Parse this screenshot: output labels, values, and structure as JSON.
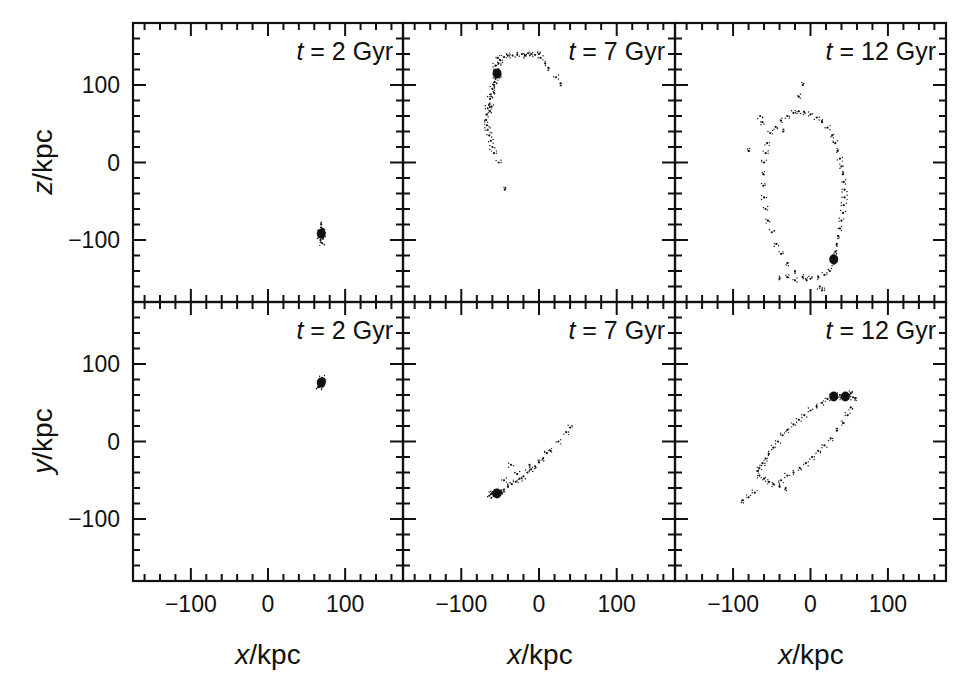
{
  "chart_data": {
    "type": "scatter",
    "title": "",
    "layout": {
      "rows": 2,
      "cols": 3,
      "shared_axes": true,
      "grid": false,
      "legend": "none"
    },
    "xlabel": "x/kpc",
    "ylabels": [
      "z/kpc",
      "y/kpc"
    ],
    "xlim": [
      -175,
      175
    ],
    "ylim": [
      -180,
      180
    ],
    "x_ticks_major": [
      -100,
      0,
      100
    ],
    "y_ticks_major": [
      -100,
      0,
      100
    ],
    "minor_tick_step": 20,
    "x_tick_labels": [
      "−100",
      "0",
      "100"
    ],
    "y_tick_labels": [
      "100",
      "0",
      "−100"
    ],
    "panels": [
      {
        "row": 0,
        "col": 0,
        "label_t": "t",
        "label_rest": " = 2 Gyr",
        "projection": "x-z",
        "core": [
          [
            69,
            -92
          ]
        ],
        "points": [
          [
            69,
            -92
          ],
          [
            70,
            -90
          ],
          [
            68,
            -94
          ],
          [
            71,
            -93
          ],
          [
            67,
            -89
          ],
          [
            70,
            -96
          ],
          [
            69,
            -84
          ],
          [
            68,
            -100
          ],
          [
            72,
            -88
          ],
          [
            66,
            -92
          ],
          [
            70,
            -104
          ],
          [
            69,
            -80
          ],
          [
            71,
            -97
          ],
          [
            67,
            -95
          ],
          [
            70,
            -87
          ]
        ]
      },
      {
        "row": 0,
        "col": 1,
        "label_t": "t",
        "label_rest": " = 7 Gyr",
        "projection": "x-z",
        "core": [
          [
            -54,
            115
          ]
        ],
        "points": [
          [
            -54,
            115
          ],
          [
            -53,
            112
          ],
          [
            -55,
            118
          ],
          [
            -52,
            110
          ],
          [
            -56,
            108
          ],
          [
            -58,
            100
          ],
          [
            -60,
            95
          ],
          [
            -62,
            88
          ],
          [
            -63,
            82
          ],
          [
            -64,
            75
          ],
          [
            -66,
            70
          ],
          [
            -67,
            62
          ],
          [
            -68,
            55
          ],
          [
            -67,
            48
          ],
          [
            -66,
            42
          ],
          [
            -64,
            35
          ],
          [
            -62,
            28
          ],
          [
            -60,
            20
          ],
          [
            -58,
            12
          ],
          [
            -52,
            0
          ],
          [
            -44,
            -35
          ],
          [
            -52,
            128
          ],
          [
            -50,
            132
          ],
          [
            -45,
            136
          ],
          [
            -40,
            138
          ],
          [
            -34,
            138
          ],
          [
            -28,
            139
          ],
          [
            -22,
            140
          ],
          [
            -18,
            138
          ],
          [
            -14,
            141
          ],
          [
            -10,
            140
          ],
          [
            -5,
            139
          ],
          [
            0,
            140
          ],
          [
            2,
            135
          ],
          [
            8,
            128
          ],
          [
            12,
            122
          ],
          [
            22,
            110
          ],
          [
            28,
            102
          ],
          [
            -56,
            125
          ],
          [
            -53,
            135
          ],
          [
            -58,
            90
          ],
          [
            -61,
            72
          ],
          [
            -63,
            66
          ],
          [
            -57,
            104
          ]
        ]
      },
      {
        "row": 0,
        "col": 2,
        "label_t": "t",
        "label_rest": " = 12 Gyr",
        "projection": "x-z",
        "core": [
          [
            30,
            -125
          ]
        ],
        "points": [
          [
            30,
            -125
          ],
          [
            31,
            -120
          ],
          [
            29,
            -130
          ],
          [
            32,
            -115
          ],
          [
            34,
            -105
          ],
          [
            36,
            -95
          ],
          [
            38,
            -85
          ],
          [
            40,
            -75
          ],
          [
            42,
            -65
          ],
          [
            43,
            -55
          ],
          [
            44,
            -45
          ],
          [
            44,
            -35
          ],
          [
            43,
            -25
          ],
          [
            42,
            -15
          ],
          [
            40,
            -5
          ],
          [
            38,
            5
          ],
          [
            35,
            15
          ],
          [
            32,
            25
          ],
          [
            28,
            35
          ],
          [
            22,
            45
          ],
          [
            15,
            52
          ],
          [
            8,
            58
          ],
          [
            0,
            62
          ],
          [
            -8,
            65
          ],
          [
            -15,
            66
          ],
          [
            -22,
            64
          ],
          [
            -30,
            60
          ],
          [
            -38,
            54
          ],
          [
            -45,
            46
          ],
          [
            -52,
            38
          ],
          [
            -56,
            25
          ],
          [
            -58,
            12
          ],
          [
            -60,
            0
          ],
          [
            -61,
            -15
          ],
          [
            -61,
            -30
          ],
          [
            -60,
            -45
          ],
          [
            -58,
            -60
          ],
          [
            -55,
            -75
          ],
          [
            -50,
            -90
          ],
          [
            -44,
            -105
          ],
          [
            -38,
            -118
          ],
          [
            -30,
            -130
          ],
          [
            -20,
            -140
          ],
          [
            -10,
            -148
          ],
          [
            0,
            -150
          ],
          [
            10,
            -148
          ],
          [
            18,
            -145
          ],
          [
            25,
            -140
          ],
          [
            -20,
            -152
          ],
          [
            -5,
            -152
          ],
          [
            12,
            -160
          ],
          [
            15,
            -165
          ],
          [
            -40,
            -150
          ],
          [
            -30,
            -148
          ],
          [
            -65,
            60
          ],
          [
            -62,
            52
          ],
          [
            -15,
            85
          ],
          [
            -10,
            100
          ],
          [
            -35,
            40
          ],
          [
            -80,
            15
          ]
        ]
      },
      {
        "row": 1,
        "col": 0,
        "label_t": "t",
        "label_rest": " = 2 Gyr",
        "projection": "x-y",
        "core": [
          [
            69,
            76
          ]
        ],
        "points": [
          [
            69,
            76
          ],
          [
            70,
            78
          ],
          [
            68,
            74
          ],
          [
            71,
            80
          ],
          [
            67,
            72
          ],
          [
            70,
            82
          ],
          [
            66,
            70
          ],
          [
            69,
            79
          ],
          [
            72,
            77
          ],
          [
            68,
            71
          ]
        ]
      },
      {
        "row": 1,
        "col": 1,
        "label_t": "t",
        "label_rest": " = 7 Gyr",
        "projection": "x-y",
        "core": [
          [
            -54,
            -67
          ]
        ],
        "points": [
          [
            -54,
            -67
          ],
          [
            -56,
            -68
          ],
          [
            -52,
            -65
          ],
          [
            -58,
            -70
          ],
          [
            -60,
            -66
          ],
          [
            -62,
            -68
          ],
          [
            -50,
            -64
          ],
          [
            -48,
            -66
          ],
          [
            -64,
            -70
          ],
          [
            -57,
            -63
          ],
          [
            -45,
            -62
          ],
          [
            -40,
            -58
          ],
          [
            -35,
            -55
          ],
          [
            -30,
            -52
          ],
          [
            -25,
            -48
          ],
          [
            -20,
            -45
          ],
          [
            -15,
            -40
          ],
          [
            -10,
            -36
          ],
          [
            -5,
            -32
          ],
          [
            0,
            -27
          ],
          [
            5,
            -22
          ],
          [
            10,
            -15
          ],
          [
            15,
            -12
          ],
          [
            25,
            0
          ],
          [
            35,
            12
          ],
          [
            40,
            18
          ],
          [
            -36,
            -30
          ],
          [
            -45,
            -50
          ],
          [
            -28,
            -42
          ],
          [
            -12,
            -30
          ]
        ]
      },
      {
        "row": 1,
        "col": 2,
        "label_t": "t",
        "label_rest": " = 12 Gyr",
        "projection": "x-y",
        "core": [
          [
            30,
            58
          ],
          [
            45,
            58
          ]
        ],
        "points": [
          [
            30,
            58
          ],
          [
            35,
            57
          ],
          [
            40,
            56
          ],
          [
            45,
            58
          ],
          [
            50,
            60
          ],
          [
            55,
            57
          ],
          [
            28,
            60
          ],
          [
            38,
            60
          ],
          [
            48,
            55
          ],
          [
            52,
            62
          ],
          [
            58,
            56
          ],
          [
            22,
            55
          ],
          [
            15,
            50
          ],
          [
            8,
            45
          ],
          [
            0,
            40
          ],
          [
            -8,
            34
          ],
          [
            -15,
            28
          ],
          [
            -22,
            22
          ],
          [
            -30,
            15
          ],
          [
            -36,
            8
          ],
          [
            -42,
            0
          ],
          [
            -48,
            -8
          ],
          [
            -54,
            -16
          ],
          [
            -58,
            -22
          ],
          [
            -62,
            -28
          ],
          [
            -66,
            -34
          ],
          [
            -68,
            -38
          ],
          [
            -66,
            -44
          ],
          [
            -60,
            -48
          ],
          [
            -54,
            -52
          ],
          [
            -48,
            -55
          ],
          [
            -40,
            -58
          ],
          [
            -32,
            -60
          ],
          [
            -38,
            -50
          ],
          [
            -30,
            -44
          ],
          [
            -22,
            -40
          ],
          [
            -14,
            -34
          ],
          [
            -6,
            -28
          ],
          [
            2,
            -20
          ],
          [
            10,
            -12
          ],
          [
            18,
            -5
          ],
          [
            26,
            4
          ],
          [
            34,
            14
          ],
          [
            42,
            24
          ],
          [
            48,
            34
          ],
          [
            52,
            44
          ],
          [
            -72,
            -66
          ],
          [
            -80,
            -72
          ],
          [
            -88,
            -76
          ]
        ]
      }
    ]
  },
  "figure": {
    "axis_titles": {
      "bottom": [
        "x/kpc",
        "x/kpc",
        "x/kpc"
      ],
      "left": [
        "z/kpc",
        "y/kpc"
      ]
    },
    "tick_labels": {
      "x": [
        "−100",
        "0",
        "100"
      ],
      "y": [
        "100",
        "0",
        "−100"
      ]
    }
  }
}
